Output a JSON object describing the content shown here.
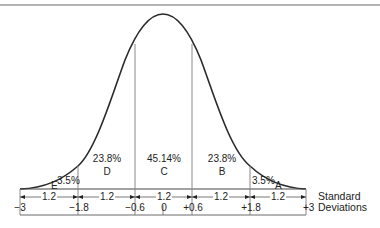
{
  "diagram": {
    "type": "normal-distribution-curve",
    "title": "",
    "regions": [
      {
        "letter": "E",
        "percent": "3.5%",
        "range": "-3 to -1.8"
      },
      {
        "letter": "D",
        "percent": "23.8%",
        "range": "-1.8 to -0.6"
      },
      {
        "letter": "C",
        "percent": "45.14%",
        "range": "-0.6 to +0.6"
      },
      {
        "letter": "B",
        "percent": "23.8%",
        "range": "+0.6 to +1.8"
      },
      {
        "letter": "A",
        "percent": "3.5%",
        "range": "+1.8 to +3"
      }
    ],
    "axis": {
      "ticks": [
        "−3",
        "−1.8",
        "−0.6",
        "0",
        "+0.6",
        "+1.8",
        "+3"
      ],
      "intervals": [
        "1.2",
        "1.2",
        "1.2",
        "1.2",
        "1.2"
      ],
      "label_line1": "Standard",
      "label_line2": "Deviations"
    },
    "colors": {
      "line": "#2a2a2a",
      "divider": "#8a8a8a",
      "background": "#ffffff"
    }
  }
}
